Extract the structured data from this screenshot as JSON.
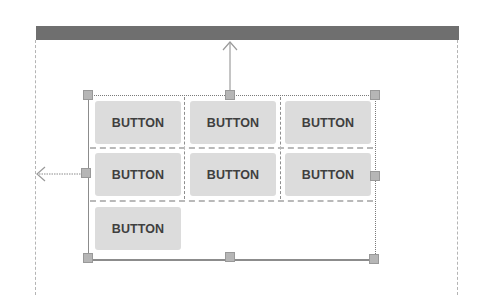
{
  "layout_editor": {
    "parent_bar": {
      "color": "#6f6f6f"
    },
    "grid": {
      "rows": [
        {
          "buttons": [
            {
              "label": "BUTTON"
            },
            {
              "label": "BUTTON"
            },
            {
              "label": "BUTTON"
            }
          ]
        },
        {
          "buttons": [
            {
              "label": "BUTTON"
            },
            {
              "label": "BUTTON"
            },
            {
              "label": "BUTTON"
            }
          ]
        },
        {
          "buttons": [
            {
              "label": "BUTTON"
            }
          ]
        }
      ]
    },
    "colors": {
      "button_bg": "#dcdcdc",
      "button_text": "#3f3f3f",
      "handle": "#b6b6b6",
      "guide_line": "#b4b4b4"
    },
    "constraints": {
      "top": "constraint-arrow-up",
      "left": "constraint-arrow-left"
    }
  }
}
